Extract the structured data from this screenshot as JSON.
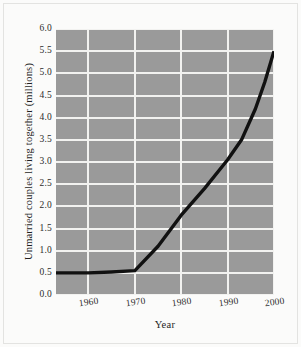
{
  "chart_data": {
    "type": "line",
    "title": "",
    "xlabel": "Year",
    "ylabel": "Unmarried couples living together (millions)",
    "xlim": [
      1953,
      2000
    ],
    "ylim": [
      0.0,
      6.0
    ],
    "grid": true,
    "legend": "none",
    "xticks": [
      1960,
      1970,
      1980,
      1990,
      2000
    ],
    "xtick_labels": [
      "1960",
      "1970",
      "1980",
      "1990",
      "2000"
    ],
    "yticks": [
      0.0,
      0.5,
      1.0,
      1.5,
      2.0,
      2.5,
      3.0,
      3.5,
      4.0,
      4.5,
      5.0,
      5.5,
      6.0
    ],
    "ytick_labels": [
      "0.0",
      "0.5",
      "1.0",
      "1.5",
      "2.0",
      "2.5",
      "3.0",
      "3.5",
      "4.0",
      "4.5",
      "5.0",
      "5.5",
      "6.0"
    ],
    "series": [
      {
        "name": "Unmarried couples living together",
        "x": [
          1953,
          1960,
          1965,
          1970,
          1975,
          1980,
          1985,
          1990,
          1993,
          1996,
          1998,
          2000
        ],
        "values": [
          0.5,
          0.5,
          0.52,
          0.55,
          1.1,
          1.8,
          2.4,
          3.05,
          3.5,
          4.2,
          4.8,
          5.5
        ]
      }
    ],
    "colors": {
      "plot_background": "#9a9a9a",
      "gridline": "#f2f2f0",
      "line": "#111111",
      "figure_background": "#fbfbfa",
      "text": "#1f1f1f"
    }
  }
}
